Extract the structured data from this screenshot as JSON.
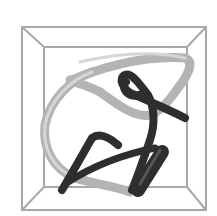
{
  "image": {
    "description": "Grayscale 3D rendering of a knotted tube inside a wireframe box",
    "width": 217,
    "height": 216
  },
  "colors": {
    "background": "#ffffff",
    "frame": "#a8a8a8",
    "light_tube": "#b4b4b4",
    "light_tube_highlight": "#d6d6d6",
    "dark_tube": "#2e2e2e",
    "dark_tube_highlight": "#555555"
  },
  "frame": {
    "outer": {
      "x1": 22,
      "y1": 27,
      "x2": 206,
      "y2": 210
    },
    "inner": {
      "x1": 44,
      "y1": 47,
      "x2": 187,
      "y2": 187
    }
  }
}
